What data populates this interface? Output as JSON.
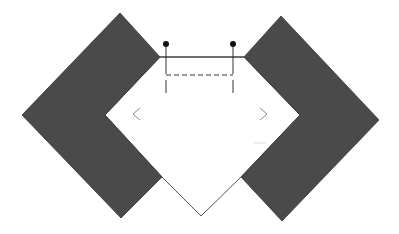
{
  "diagram": {
    "width": 399,
    "height": 234,
    "background": "#ffffff",
    "colors": {
      "chevron_fill": "#4a4a4a",
      "outline": "#555555",
      "line": "#333333",
      "dot": "#111111",
      "arrow": "#888888",
      "faint": "#dddddd"
    },
    "left_chevron": {
      "points": "120,13 160,57 105,115 162,177 121,218 22,115"
    },
    "right_chevron": {
      "points": "281,16 379,120 282,221 241,177 300,115 244,57"
    },
    "center_pentagon": {
      "points": "160,57 244,57 300,115 241,177 201,216 162,177 105,115"
    },
    "top_line": {
      "x1": 160,
      "y1": 57,
      "x2": 244,
      "y2": 57
    },
    "dashed_line": {
      "x1": 166,
      "y1": 75,
      "x2": 233,
      "y2": 75
    },
    "pins": [
      {
        "x": 166,
        "dot_y": 44,
        "y_top": 44,
        "y_mid": 74,
        "y_gap": 80,
        "y_bottom": 93
      },
      {
        "x": 233,
        "dot_y": 44,
        "y_top": 44,
        "y_mid": 74,
        "y_gap": 80,
        "y_bottom": 93
      }
    ],
    "left_arrow": {
      "glyph": "<",
      "points": "140,108 133,114 140,120"
    },
    "right_arrow": {
      "glyph": ">",
      "points": "260,108 267,114 260,120"
    },
    "faint_line": {
      "x1": 253,
      "y1": 143,
      "x2": 266,
      "y2": 143
    }
  }
}
